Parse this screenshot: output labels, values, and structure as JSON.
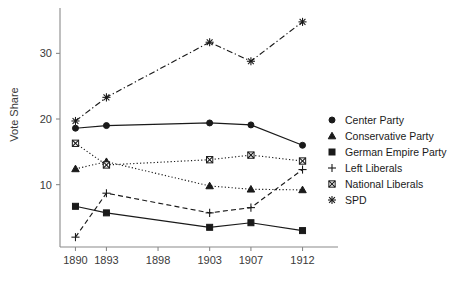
{
  "chart_data": {
    "type": "line",
    "title": "",
    "xlabel": "",
    "ylabel": "Vote Share",
    "x": [
      1890,
      1893,
      1898,
      1903,
      1907,
      1912
    ],
    "x_tick_labels": [
      "1890",
      "1893",
      "1898",
      "1903",
      "1907",
      "1912"
    ],
    "y_tick_labels": [
      "10",
      "20",
      "30"
    ],
    "y_ticks": [
      10,
      20,
      30
    ],
    "ylim": [
      0.5,
      36
    ],
    "xlim": [
      1888.5,
      1913.5
    ],
    "grid": false,
    "legend_position": "right",
    "note": "No data plotted at 1898; all series skip that year.",
    "series": [
      {
        "name": "Center Party",
        "marker": "filled-circle",
        "linestyle": "solid",
        "x": [
          1890,
          1893,
          1903,
          1907,
          1912
        ],
        "values": [
          18.6,
          19.0,
          19.4,
          19.1,
          16.0
        ]
      },
      {
        "name": "Conservative Party",
        "marker": "filled-triangle",
        "linestyle": "dotted",
        "x": [
          1890,
          1893,
          1903,
          1907,
          1912
        ],
        "values": [
          12.4,
          13.5,
          9.8,
          9.3,
          9.2
        ]
      },
      {
        "name": "German Empire Party",
        "marker": "filled-square",
        "linestyle": "solid",
        "x": [
          1890,
          1893,
          1903,
          1907,
          1912
        ],
        "values": [
          6.7,
          5.7,
          3.5,
          4.2,
          3.0
        ]
      },
      {
        "name": "Left Liberals",
        "marker": "plus",
        "linestyle": "dashed",
        "x": [
          1890,
          1893,
          1903,
          1907,
          1912
        ],
        "values": [
          2.0,
          8.7,
          5.7,
          6.5,
          12.3
        ]
      },
      {
        "name": "National Liberals",
        "marker": "circle-cross",
        "linestyle": "dotted",
        "x": [
          1890,
          1893,
          1903,
          1907,
          1912
        ],
        "values": [
          16.3,
          13.0,
          13.8,
          14.5,
          13.6
        ]
      },
      {
        "name": "SPD",
        "marker": "asterisk",
        "linestyle": "dashdot",
        "x": [
          1890,
          1893,
          1903,
          1907,
          1912
        ],
        "values": [
          19.7,
          23.3,
          31.7,
          28.8,
          34.8
        ]
      }
    ],
    "colors": {
      "ink": "#1a1a1a",
      "axis": "#8a8a8a",
      "background": "#ffffff"
    }
  }
}
